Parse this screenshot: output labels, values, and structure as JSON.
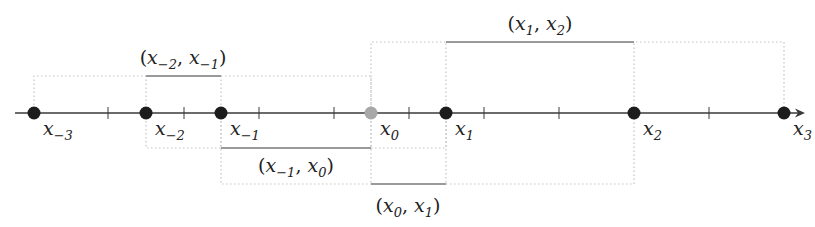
{
  "diagram": {
    "type": "number-line-intervals",
    "colors": {
      "axis": "#3a3a3a",
      "point": "#1c1c1c",
      "origin_point": "#a8a8a8",
      "interval_bar": "#9a9a9a",
      "dotted_box": "#c4c4c4",
      "text": "#222222"
    },
    "axis": {
      "y": 113,
      "x_start": 15,
      "x_end": 805,
      "arrow": true
    },
    "ticks_x": [
      108,
      184,
      259,
      334,
      409,
      484,
      559,
      709
    ],
    "points": [
      {
        "id": "x_-3",
        "x": 34,
        "label_base": "x",
        "label_sub": "−3",
        "highlight": false
      },
      {
        "id": "x_-2",
        "x": 146,
        "label_base": "x",
        "label_sub": "−2",
        "highlight": false
      },
      {
        "id": "x_-1",
        "x": 221,
        "label_base": "x",
        "label_sub": "−1",
        "highlight": false
      },
      {
        "id": "x_0",
        "x": 371,
        "label_base": "x",
        "label_sub": "0",
        "highlight": true
      },
      {
        "id": "x_1",
        "x": 446,
        "label_base": "x",
        "label_sub": "1",
        "highlight": false
      },
      {
        "id": "x_2",
        "x": 634,
        "label_base": "x",
        "label_sub": "2",
        "highlight": false
      },
      {
        "id": "x_3",
        "x": 784,
        "label_base": "x",
        "label_sub": "3",
        "highlight": false
      }
    ],
    "intervals": [
      {
        "id": "x-2_x-1",
        "label": "(x₋₂, x₋₁)",
        "a": "x",
        "a_sub": "−2",
        "b": "x",
        "b_sub": "−1",
        "bar_x1": 146,
        "bar_x2": 221,
        "bar_y": 76,
        "label_x": 183,
        "label_y": 64,
        "box": {
          "x1": 34,
          "x2": 371,
          "y": 76,
          "side": "above"
        }
      },
      {
        "id": "x1_x2",
        "label": "(x₁, x₂)",
        "a": "x",
        "a_sub": "1",
        "b": "x",
        "b_sub": "2",
        "bar_x1": 446,
        "bar_x2": 634,
        "bar_y": 42,
        "label_x": 540,
        "label_y": 30,
        "box": {
          "x1": 371,
          "x2": 784,
          "y": 42,
          "side": "above"
        }
      },
      {
        "id": "x-1_x0",
        "label": "(x₋₁, x₀)",
        "a": "x",
        "a_sub": "−1",
        "b": "x",
        "b_sub": "0",
        "bar_x1": 221,
        "bar_x2": 371,
        "bar_y": 148,
        "label_x": 296,
        "label_y": 172,
        "box": {
          "x1": 146,
          "x2": 446,
          "y": 148,
          "side": "below"
        }
      },
      {
        "id": "x0_x1",
        "label": "(x₀, x₁)",
        "a": "x",
        "a_sub": "0",
        "b": "x",
        "b_sub": "1",
        "bar_x1": 371,
        "bar_x2": 446,
        "bar_y": 184,
        "label_x": 408,
        "label_y": 212,
        "box": {
          "x1": 221,
          "x2": 634,
          "y": 184,
          "side": "below"
        }
      }
    ]
  }
}
